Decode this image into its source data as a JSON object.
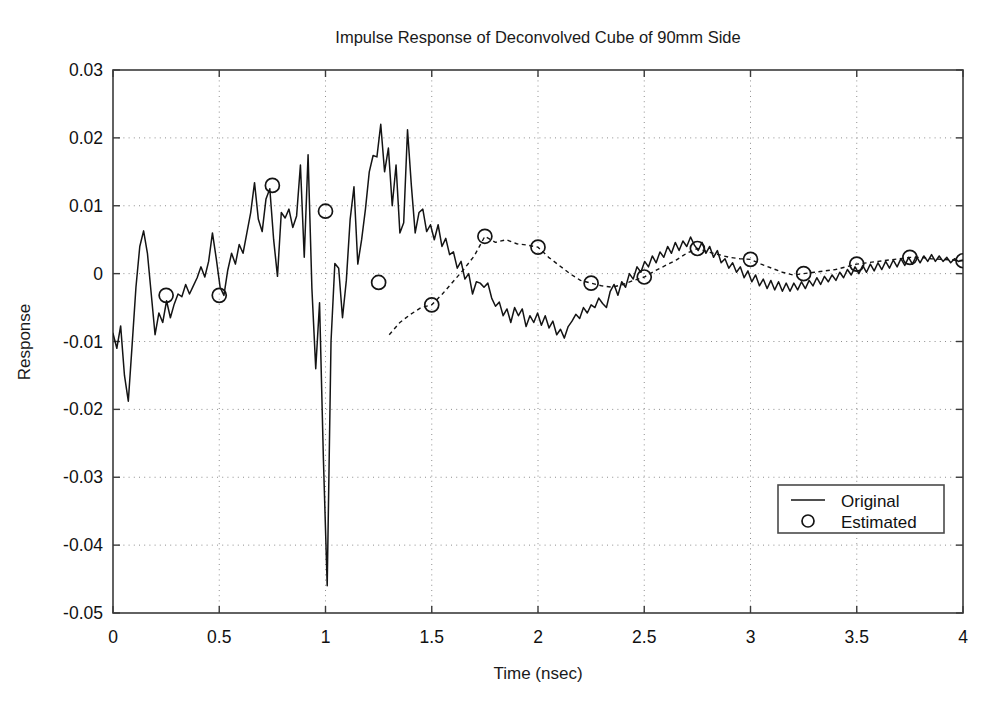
{
  "chart_data": {
    "type": "line",
    "title": "Impulse Response of Deconvolved Cube of 90mm Side",
    "xlabel": "Time (nsec)",
    "ylabel": "Response",
    "xlim": [
      0,
      4
    ],
    "ylim": [
      -0.05,
      0.03
    ],
    "grid": true,
    "xticks": [
      0,
      0.5,
      1,
      1.5,
      2,
      2.5,
      3,
      3.5,
      4
    ],
    "xtick_labels": [
      "0",
      "0.5",
      "1",
      "1.5",
      "2",
      "2.5",
      "3",
      "3.5",
      "4"
    ],
    "yticks": [
      0.03,
      0.02,
      0.01,
      0,
      -0.01,
      -0.02,
      -0.03,
      -0.04,
      -0.05
    ],
    "ytick_labels": [
      "0.03",
      "0.02",
      "0.01",
      "0",
      "-0.01",
      "-0.02",
      "-0.03",
      "-0.04",
      "-0.05"
    ],
    "legend": {
      "position": "lower-right",
      "entries": [
        {
          "label": "Original",
          "style": "solid-line",
          "marker": "none"
        },
        {
          "label": "Estimated",
          "style": "none",
          "marker": "circle"
        }
      ]
    },
    "series": [
      {
        "name": "Original",
        "style": "solid-line",
        "x": [
          0.0,
          0.018,
          0.036,
          0.054,
          0.072,
          0.09,
          0.108,
          0.126,
          0.144,
          0.162,
          0.18,
          0.198,
          0.216,
          0.234,
          0.252,
          0.27,
          0.288,
          0.306,
          0.324,
          0.342,
          0.36,
          0.378,
          0.396,
          0.414,
          0.432,
          0.45,
          0.468,
          0.486,
          0.504,
          0.522,
          0.54,
          0.558,
          0.576,
          0.594,
          0.612,
          0.63,
          0.648,
          0.666,
          0.684,
          0.702,
          0.72,
          0.738,
          0.756,
          0.774,
          0.792,
          0.81,
          0.828,
          0.846,
          0.864,
          0.882,
          0.9,
          0.918,
          0.936,
          0.954,
          0.972,
          0.99,
          1.008,
          1.026,
          1.044,
          1.062,
          1.08,
          1.098,
          1.116,
          1.134,
          1.152,
          1.17,
          1.188,
          1.206,
          1.224,
          1.242,
          1.26,
          1.278,
          1.296,
          1.314,
          1.332,
          1.35,
          1.368,
          1.386,
          1.404,
          1.422,
          1.44,
          1.458,
          1.476,
          1.494,
          1.512,
          1.53,
          1.548,
          1.566,
          1.584,
          1.602,
          1.62,
          1.638,
          1.656,
          1.674,
          1.692,
          1.71,
          1.728,
          1.746,
          1.764,
          1.782,
          1.8,
          1.818,
          1.836,
          1.854,
          1.872,
          1.89,
          1.908,
          1.926,
          1.944,
          1.962,
          1.98,
          1.998,
          2.016,
          2.034,
          2.052,
          2.07,
          2.088,
          2.106,
          2.124,
          2.142,
          2.16,
          2.178,
          2.196,
          2.214,
          2.232,
          2.25,
          2.268,
          2.286,
          2.304,
          2.322,
          2.34,
          2.358,
          2.376,
          2.394,
          2.412,
          2.43,
          2.448,
          2.466,
          2.484,
          2.502,
          2.52,
          2.538,
          2.556,
          2.574,
          2.592,
          2.61,
          2.628,
          2.646,
          2.664,
          2.682,
          2.7,
          2.718,
          2.736,
          2.754,
          2.772,
          2.79,
          2.808,
          2.826,
          2.844,
          2.862,
          2.88,
          2.898,
          2.916,
          2.934,
          2.952,
          2.97,
          2.988,
          3.006,
          3.024,
          3.042,
          3.06,
          3.078,
          3.096,
          3.114,
          3.132,
          3.15,
          3.168,
          3.186,
          3.204,
          3.222,
          3.24,
          3.258,
          3.276,
          3.294,
          3.312,
          3.33,
          3.348,
          3.366,
          3.384,
          3.402,
          3.42,
          3.438,
          3.456,
          3.474,
          3.492,
          3.51,
          3.528,
          3.546,
          3.564,
          3.582,
          3.6,
          3.618,
          3.636,
          3.654,
          3.672,
          3.69,
          3.708,
          3.726,
          3.744,
          3.762,
          3.78,
          3.798,
          3.816,
          3.834,
          3.852,
          3.87,
          3.888,
          3.906,
          3.924,
          3.942,
          3.96,
          3.978,
          4.0
        ],
        "y": [
          -0.0088,
          -0.011,
          -0.0077,
          -0.015,
          -0.0188,
          -0.0105,
          -0.002,
          0.004,
          0.0063,
          0.003,
          -0.003,
          -0.009,
          -0.0058,
          -0.0072,
          -0.004,
          -0.0065,
          -0.0045,
          -0.003,
          -0.0034,
          -0.0016,
          -0.003,
          -0.0018,
          -0.0006,
          0.001,
          -0.0005,
          0.0018,
          0.006,
          0.0022,
          -0.002,
          -0.0032,
          0.0005,
          0.003,
          0.0014,
          0.0043,
          0.003,
          0.006,
          0.009,
          0.0134,
          0.008,
          0.0062,
          0.011,
          0.0125,
          0.005,
          -0.0004,
          0.009,
          0.0082,
          0.0095,
          0.0068,
          0.0085,
          0.016,
          0.0024,
          0.0175,
          -0.0022,
          -0.014,
          -0.0043,
          -0.0272,
          -0.046,
          -0.01,
          0.0015,
          0.0008,
          -0.0065,
          -0.001,
          0.008,
          0.0128,
          0.0014,
          0.005,
          0.0095,
          0.015,
          0.0174,
          0.0172,
          0.022,
          0.015,
          0.0185,
          0.01,
          0.016,
          0.006,
          0.0075,
          0.0212,
          0.013,
          0.006,
          0.009,
          0.0095,
          0.0062,
          0.0072,
          0.005,
          0.0072,
          0.004,
          0.0052,
          0.0028,
          0.0032,
          0.0008,
          0.0018,
          -0.0008,
          0.0,
          -0.003,
          -0.0012,
          -0.0014,
          -0.002,
          -0.0014,
          -0.0036,
          -0.0048,
          -0.0042,
          -0.0062,
          -0.0052,
          -0.0072,
          -0.005,
          -0.0062,
          -0.0052,
          -0.0078,
          -0.0062,
          -0.0072,
          -0.0058,
          -0.0076,
          -0.0062,
          -0.008,
          -0.007,
          -0.009,
          -0.0082,
          -0.0095,
          -0.0078,
          -0.007,
          -0.006,
          -0.0066,
          -0.005,
          -0.0058,
          -0.0046,
          -0.005,
          -0.0036,
          -0.0044,
          -0.005,
          -0.0026,
          -0.0016,
          -0.0032,
          -0.0012,
          -0.002,
          0.0,
          -0.0008,
          0.001,
          0.0002,
          0.0018,
          0.001,
          0.0026,
          0.0016,
          0.0032,
          0.0024,
          0.004,
          0.003,
          0.0046,
          0.0034,
          0.0048,
          0.004,
          0.0054,
          0.0042,
          0.0034,
          0.0046,
          0.003,
          0.004,
          0.0024,
          0.0034,
          0.0016,
          0.0022,
          0.0008,
          0.0016,
          0.0002,
          0.001,
          -0.0006,
          0.0004,
          -0.0012,
          -0.0002,
          -0.0018,
          -0.0008,
          -0.0022,
          -0.001,
          -0.0024,
          -0.0012,
          -0.0026,
          -0.0014,
          -0.0026,
          -0.0014,
          -0.0024,
          -0.0012,
          -0.0022,
          -0.001,
          -0.0018,
          -0.0006,
          -0.0016,
          -0.0004,
          -0.0012,
          -0.0002,
          -0.001,
          0.0002,
          -0.0006,
          0.0006,
          -0.0002,
          0.001,
          0.0,
          0.0012,
          0.0002,
          0.0014,
          0.0004,
          0.0016,
          0.0006,
          0.0018,
          0.0008,
          0.002,
          0.001,
          0.0022,
          0.0012,
          0.0024,
          0.0014,
          0.0026,
          0.0016,
          0.0026,
          0.0018,
          0.0028,
          0.0018,
          0.0026,
          0.0018,
          0.0024,
          0.0016,
          0.0022,
          0.0018,
          0.002
        ]
      },
      {
        "name": "Estimated",
        "style": "dashed-line-with-circle-markers",
        "marker": "circle",
        "marker_x": [
          0.25,
          0.5,
          0.75,
          1.0,
          1.25,
          1.5,
          1.75,
          2.0,
          2.25,
          2.5,
          2.75,
          3.0,
          3.25,
          3.5,
          3.75,
          4.0
        ],
        "marker_y": [
          -0.0032,
          -0.0032,
          0.013,
          0.0092,
          -0.0013,
          -0.0046,
          0.0055,
          0.0039,
          -0.0014,
          -0.0005,
          0.0037,
          0.0021,
          0.0,
          0.0014,
          0.0024,
          0.0019
        ],
        "x": [
          1.3,
          1.35,
          1.4,
          1.45,
          1.5,
          1.55,
          1.6,
          1.65,
          1.7,
          1.75,
          1.8,
          1.85,
          1.9,
          1.95,
          2.0,
          2.05,
          2.1,
          2.15,
          2.2,
          2.25,
          2.3,
          2.35,
          2.4,
          2.45,
          2.5,
          2.55,
          2.6,
          2.65,
          2.7,
          2.75,
          2.8,
          2.85,
          2.9,
          2.95,
          3.0,
          3.05,
          3.1,
          3.15,
          3.2,
          3.25,
          3.3,
          3.35,
          3.4,
          3.45,
          3.5,
          3.55,
          3.6,
          3.65,
          3.7,
          3.75,
          3.8,
          3.85,
          3.9,
          3.95,
          4.0
        ],
        "y": [
          -0.009,
          -0.0072,
          -0.006,
          -0.005,
          -0.0046,
          -0.003,
          -0.0012,
          0.0006,
          0.0026,
          0.0055,
          0.0046,
          0.005,
          0.0044,
          0.0042,
          0.0039,
          0.0024,
          0.0012,
          0.0,
          -0.001,
          -0.0014,
          -0.0018,
          -0.002,
          -0.0016,
          -0.001,
          -0.0005,
          0.0004,
          0.0012,
          0.002,
          0.003,
          0.0037,
          0.0032,
          0.0028,
          0.0024,
          0.0022,
          0.0021,
          0.0014,
          0.0008,
          0.0002,
          -0.0002,
          0.0,
          0.0002,
          0.0004,
          0.0006,
          0.001,
          0.0014,
          0.0016,
          0.0018,
          0.002,
          0.0022,
          0.0024,
          0.0024,
          0.0022,
          0.0021,
          0.002,
          0.0019
        ]
      }
    ]
  }
}
